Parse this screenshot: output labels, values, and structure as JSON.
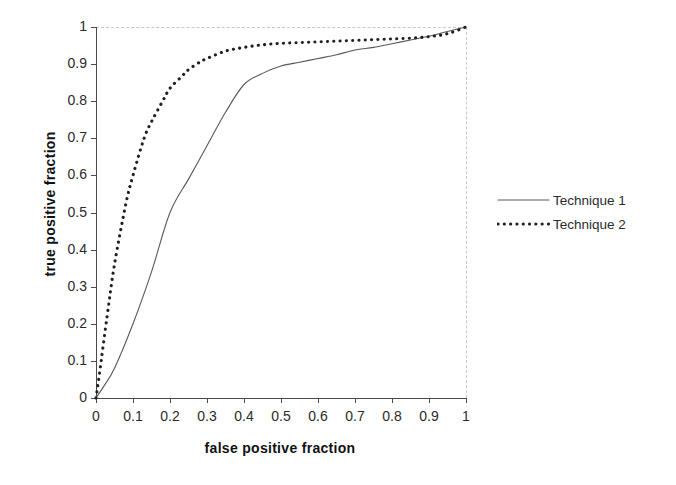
{
  "chart_data": {
    "type": "line",
    "title": "",
    "xlabel": "false positive fraction",
    "ylabel": "true positive fraction",
    "xlim": [
      0,
      1
    ],
    "ylim": [
      0,
      1
    ],
    "xticks": [
      "0",
      "0.1",
      "0.2",
      "0.3",
      "0.4",
      "0.5",
      "0.6",
      "0.7",
      "0.8",
      "0.9",
      "1"
    ],
    "yticks": [
      "0",
      "0.1",
      "0.2",
      "0.3",
      "0.4",
      "0.5",
      "0.6",
      "0.7",
      "0.8",
      "0.9",
      "1"
    ],
    "xtick_values": [
      0,
      0.1,
      0.2,
      0.3,
      0.4,
      0.5,
      0.6,
      0.7,
      0.8,
      0.9,
      1
    ],
    "ytick_values": [
      0,
      0.1,
      0.2,
      0.3,
      0.4,
      0.5,
      0.6,
      0.7,
      0.8,
      0.9,
      1
    ],
    "grid": "dashed border gridlines at x=1 and y=1 only",
    "legend_position": "right-outside",
    "series": [
      {
        "name": "Technique 1",
        "style": "solid",
        "color": "#585858",
        "x": [
          0,
          0.02,
          0.05,
          0.1,
          0.15,
          0.2,
          0.25,
          0.3,
          0.35,
          0.4,
          0.45,
          0.5,
          0.55,
          0.6,
          0.65,
          0.7,
          0.75,
          0.8,
          0.85,
          0.9,
          0.95,
          1.0
        ],
        "y": [
          0,
          0.03,
          0.08,
          0.2,
          0.34,
          0.5,
          0.59,
          0.68,
          0.77,
          0.845,
          0.875,
          0.895,
          0.905,
          0.915,
          0.925,
          0.938,
          0.945,
          0.955,
          0.965,
          0.975,
          0.988,
          1.0
        ]
      },
      {
        "name": "Technique 2",
        "style": "dotted",
        "color": "#1f1f1f",
        "x": [
          0,
          0.01,
          0.03,
          0.05,
          0.08,
          0.1,
          0.13,
          0.15,
          0.18,
          0.2,
          0.23,
          0.25,
          0.28,
          0.3,
          0.35,
          0.4,
          0.45,
          0.5,
          0.55,
          0.6,
          0.65,
          0.7,
          0.75,
          0.8,
          0.85,
          0.9,
          0.95,
          1.0
        ],
        "y": [
          0,
          0.07,
          0.22,
          0.36,
          0.52,
          0.6,
          0.7,
          0.745,
          0.8,
          0.835,
          0.865,
          0.885,
          0.905,
          0.915,
          0.935,
          0.945,
          0.952,
          0.956,
          0.958,
          0.96,
          0.962,
          0.964,
          0.966,
          0.968,
          0.97,
          0.974,
          0.982,
          1.0
        ]
      }
    ],
    "legend": [
      {
        "label": "Technique 1",
        "style": "solid"
      },
      {
        "label": "Technique 2",
        "style": "dotted"
      }
    ]
  }
}
